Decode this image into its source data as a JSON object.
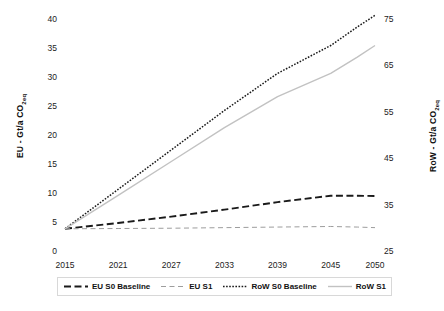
{
  "chart_data": {
    "type": "line",
    "title": "",
    "xlabel": "",
    "ylabel": "EU - Gt/a CO2eq",
    "ylabel_right": "RoW - Gt/a CO2eq",
    "grid": false,
    "legend_position": "bottom",
    "x": [
      2015,
      2021,
      2027,
      2033,
      2039,
      2045,
      2050
    ],
    "xtick_labels": [
      "2015",
      "2021",
      "2027",
      "2033",
      "2039",
      "2045",
      "2050"
    ],
    "xlim": [
      2015,
      2050
    ],
    "ylim_left": [
      0,
      40
    ],
    "ytick_labels_left": [
      "0",
      "5",
      "10",
      "15",
      "20",
      "25",
      "30",
      "35",
      "40"
    ],
    "ytick_values_left": [
      0,
      5,
      10,
      15,
      20,
      25,
      30,
      35,
      40
    ],
    "ylim_right": [
      25,
      75
    ],
    "ytick_labels_right": [
      "25",
      "35",
      "45",
      "55",
      "65",
      "75"
    ],
    "ytick_values_right": [
      25,
      35,
      45,
      55,
      65,
      75
    ],
    "series": [
      {
        "name": "EU S0 Baseline",
        "axis": "left",
        "style": "dashed",
        "color": "#1a1a1a",
        "width": 1.9,
        "x": [
          2015,
          2021,
          2027,
          2033,
          2039,
          2045,
          2048,
          2050
        ],
        "values": [
          4.0,
          5.0,
          6.1,
          7.3,
          8.6,
          9.7,
          9.7,
          9.65
        ]
      },
      {
        "name": "EU S1",
        "axis": "left",
        "style": "dashed-light",
        "color": "#9d9d9d",
        "width": 1.0,
        "x": [
          2015,
          2021,
          2027,
          2033,
          2039,
          2045,
          2048,
          2050
        ],
        "values": [
          4.0,
          4.05,
          4.1,
          4.2,
          4.3,
          4.4,
          4.3,
          4.2
        ]
      },
      {
        "name": "RoW S0 Baseline",
        "axis": "right",
        "style": "dotted",
        "color": "#1a1a1a",
        "width": 1.5,
        "x": [
          2015,
          2021,
          2027,
          2033,
          2039,
          2045,
          2048,
          2050
        ],
        "values": [
          30.0,
          38.5,
          47.0,
          55.5,
          63.5,
          69.5,
          73.5,
          76.0
        ]
      },
      {
        "name": "RoW S1",
        "axis": "right",
        "style": "solid-light",
        "color": "#c2c2c2",
        "width": 1.4,
        "x": [
          2015,
          2021,
          2027,
          2033,
          2039,
          2045,
          2048,
          2050
        ],
        "values": [
          30.0,
          37.2,
          44.5,
          51.8,
          58.5,
          63.5,
          67.0,
          69.5
        ]
      }
    ]
  },
  "axes": {
    "left_title": "EU - Gt/a CO",
    "left_title_sub": "2eq",
    "right_title": "RoW - Gt/a CO",
    "right_title_sub": "2eq"
  },
  "legend": {
    "items": [
      {
        "label": "EU S0 Baseline",
        "swatch": "dashed"
      },
      {
        "label": "EU S1",
        "swatch": "dashed-light"
      },
      {
        "label": "RoW S0 Baseline",
        "swatch": "dotted"
      },
      {
        "label": "RoW S1",
        "swatch": "solid-light"
      }
    ]
  }
}
